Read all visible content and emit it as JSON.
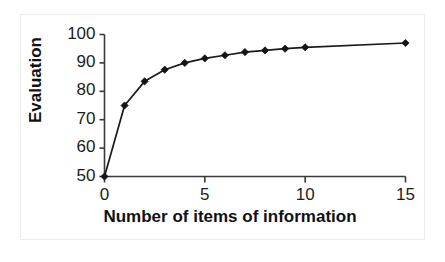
{
  "figure": {
    "background_color": "#ffffff",
    "frame_color": "#ececec",
    "line_color": "#1a1a1a",
    "marker_color": "#141414",
    "axis_color": "#3a3a3a"
  },
  "chart_data": {
    "type": "line",
    "title": "",
    "xlabel": "Number of items of information",
    "ylabel": "Evaluation",
    "xlim": [
      0,
      15
    ],
    "ylim": [
      50,
      100
    ],
    "grid": false,
    "legend": null,
    "marker": "diamond",
    "x_ticks": [
      "0",
      "5",
      "10",
      "15"
    ],
    "x_tick_values": [
      0,
      5,
      10,
      15
    ],
    "y_ticks": [
      "50",
      "60",
      "70",
      "80",
      "90",
      "100"
    ],
    "y_tick_values": [
      50,
      60,
      70,
      80,
      90,
      100
    ],
    "x": [
      0,
      1,
      2,
      3,
      4,
      5,
      6,
      7,
      8,
      9,
      10,
      15
    ],
    "values": [
      50,
      75,
      83.5,
      87.6,
      90,
      91.6,
      92.7,
      93.8,
      94.4,
      95,
      95.5,
      97
    ],
    "series": [
      {
        "name": "Evaluation",
        "x": [
          0,
          1,
          2,
          3,
          4,
          5,
          6,
          7,
          8,
          9,
          10,
          15
        ],
        "values": [
          50,
          75,
          83.5,
          87.6,
          90,
          91.6,
          92.7,
          93.8,
          94.4,
          95,
          95.5,
          97
        ]
      }
    ]
  }
}
